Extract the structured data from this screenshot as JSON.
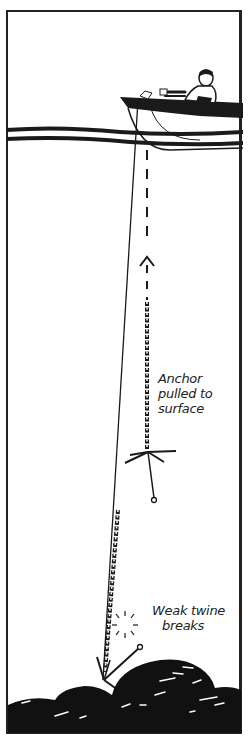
{
  "illustration": {
    "subject": "Retrieving a snagged anchor with a trip line",
    "elements": [
      "boat",
      "rower",
      "water-surface",
      "anchor-rode",
      "chain",
      "anchor",
      "weak-twine",
      "snag-rocks",
      "direction-arrow"
    ]
  },
  "labels": {
    "anchor_pulled": {
      "lines": [
        "Anchor",
        "pulled to",
        "surface"
      ]
    },
    "weak_twine": {
      "lines": [
        "Weak twine",
        "breaks"
      ]
    }
  },
  "colors": {
    "ink": "#1a1a1a",
    "background": "#ffffff"
  }
}
